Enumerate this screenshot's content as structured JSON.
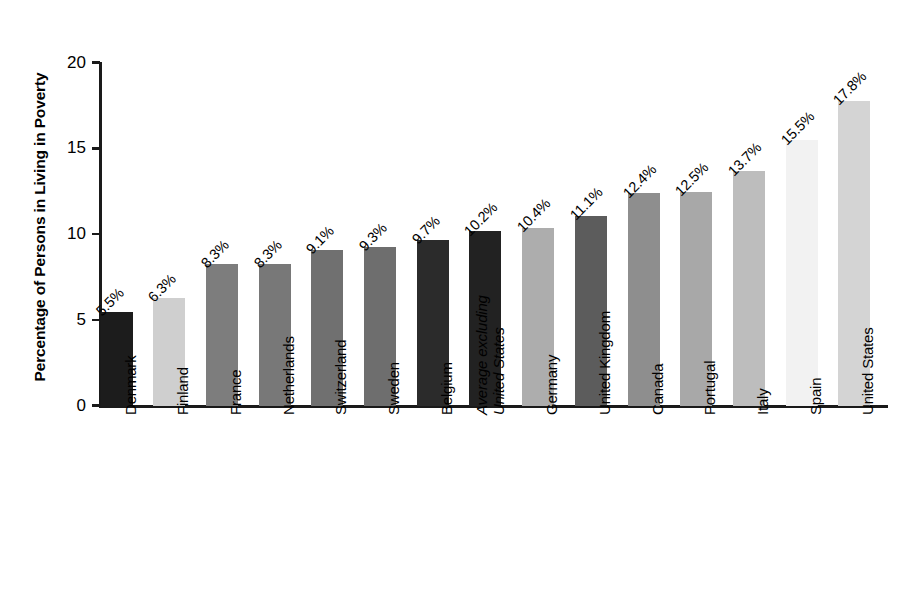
{
  "chart_data": {
    "type": "bar",
    "title": "",
    "xlabel": "",
    "ylabel": "Percentage of Persons in Living in Poverty",
    "ylim": [
      0,
      20
    ],
    "ytick_values": [
      0,
      5,
      10,
      15,
      20
    ],
    "ytick_labels": [
      "0",
      "5",
      "10",
      "15",
      "20"
    ],
    "grid": false,
    "legend": "none",
    "categories": [
      "Denmark",
      "Finland",
      "France",
      "Netherlands",
      "Switzerland",
      "Sweden",
      "Belgium",
      "Average excluding United States",
      "Germany",
      "United Kingdom",
      "Canada",
      "Portugal",
      "Italy",
      "Spain",
      "United States"
    ],
    "values": [
      5.5,
      6.3,
      8.3,
      8.3,
      9.1,
      9.3,
      9.7,
      10.2,
      10.4,
      11.1,
      12.4,
      12.5,
      13.7,
      15.5,
      17.8
    ],
    "data_labels": [
      "5.5%",
      "6.3%",
      "8.3%",
      "8.3%",
      "9.1%",
      "9.3%",
      "9.7%",
      "10.2%",
      "10.4%",
      "11.1%",
      "12.4%",
      "12.5%",
      "13.7%",
      "15.5%",
      "17.8%"
    ],
    "bar_colors": [
      "#1c1c1c",
      "#cfcfcf",
      "#7d7d7d",
      "#787878",
      "#707070",
      "#6e6e6e",
      "#2b2b2b",
      "#222222",
      "#adadad",
      "#5c5c5c",
      "#8e8e8e",
      "#a8a8a8",
      "#bdbdbd",
      "#f2f2f2",
      "#d4d4d4"
    ],
    "label_styles": [
      "normal",
      "normal",
      "normal",
      "normal",
      "normal",
      "normal",
      "normal",
      "italic",
      "normal",
      "normal",
      "normal",
      "normal",
      "normal",
      "normal",
      "normal"
    ],
    "label_lines": [
      [
        "Denmark"
      ],
      [
        "Finland"
      ],
      [
        "France"
      ],
      [
        "Netherlands"
      ],
      [
        "Switzerland"
      ],
      [
        "Sweden"
      ],
      [
        "Belgium"
      ],
      [
        "Average excluding",
        "United States"
      ],
      [
        "Germany"
      ],
      [
        "United Kingdom"
      ],
      [
        "Canada"
      ],
      [
        "Portugal"
      ],
      [
        "Italy"
      ],
      [
        "Spain"
      ],
      [
        "United States"
      ]
    ],
    "axis_color": "#1a1a1a",
    "background_color": "#ffffff"
  }
}
